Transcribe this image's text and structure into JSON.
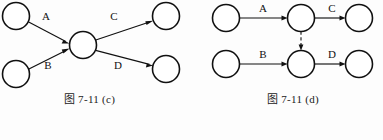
{
  "page": {
    "background_color": "#fdfdfd",
    "ink_color": "#111111"
  },
  "figures": [
    {
      "id": "c",
      "caption": "图 7-11 (c)",
      "layout": "converging-diverging",
      "nodes": [
        {
          "name": "source-top",
          "cx": 16,
          "cy": 16,
          "r": 13.5
        },
        {
          "name": "source-bottom",
          "cx": 16,
          "cy": 74,
          "r": 13.5
        },
        {
          "name": "center",
          "cx": 83,
          "cy": 45,
          "r": 13.5
        },
        {
          "name": "sink-top",
          "cx": 166,
          "cy": 16,
          "r": 13.5
        },
        {
          "name": "sink-bottom",
          "cx": 166,
          "cy": 69,
          "r": 13.5
        }
      ],
      "edges": [
        {
          "label": "A",
          "from": "source-top",
          "to": "center",
          "style": "solid",
          "lx": 46,
          "ly": 17
        },
        {
          "label": "B",
          "from": "source-bottom",
          "to": "center",
          "style": "solid",
          "lx": 48,
          "ly": 66
        },
        {
          "label": "C",
          "from": "center",
          "to": "sink-top",
          "style": "solid",
          "lx": 114,
          "ly": 17
        },
        {
          "label": "D",
          "from": "center",
          "to": "sink-bottom",
          "style": "solid",
          "lx": 118,
          "ly": 66
        }
      ]
    },
    {
      "id": "d",
      "caption": "图 7-11 (d)",
      "layout": "two-parallel-chains-with-dashed-link",
      "nodes": [
        {
          "name": "top-start",
          "cx": 35,
          "cy": 18,
          "r": 13.5
        },
        {
          "name": "top-middle",
          "cx": 110,
          "cy": 18,
          "r": 13.5
        },
        {
          "name": "top-end",
          "cx": 168,
          "cy": 18,
          "r": 13.5
        },
        {
          "name": "bottom-start",
          "cx": 35,
          "cy": 64,
          "r": 13.5
        },
        {
          "name": "bottom-middle",
          "cx": 110,
          "cy": 64,
          "r": 13.5
        },
        {
          "name": "bottom-end",
          "cx": 168,
          "cy": 64,
          "r": 13.5
        }
      ],
      "edges": [
        {
          "label": "A",
          "from": "top-start",
          "to": "top-middle",
          "style": "solid",
          "lx": 72,
          "ly": 9
        },
        {
          "label": "C",
          "from": "top-middle",
          "to": "top-end",
          "style": "solid",
          "lx": 141,
          "ly": 9
        },
        {
          "label": "B",
          "from": "bottom-start",
          "to": "bottom-middle",
          "style": "solid",
          "lx": 72,
          "ly": 55
        },
        {
          "label": "D",
          "from": "bottom-middle",
          "to": "bottom-end",
          "style": "solid",
          "lx": 141,
          "ly": 55
        },
        {
          "label": "",
          "from": "top-middle",
          "to": "bottom-middle",
          "style": "dashed",
          "lx": 0,
          "ly": 0
        }
      ]
    }
  ]
}
